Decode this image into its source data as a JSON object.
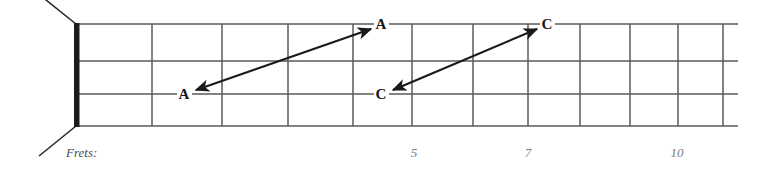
{
  "diagram": {
    "type": "guitar-fretboard",
    "caption": "Frets:",
    "nut": {
      "label": "nut"
    },
    "strings": {
      "count": 4,
      "lines_y": [
        24,
        61,
        94,
        126
      ]
    },
    "frets": {
      "count": 12,
      "lines_x": [
        77,
        152,
        222,
        288,
        353,
        412,
        473,
        528,
        580,
        630,
        678,
        723
      ],
      "numbers": [
        {
          "label": "5",
          "x": 414
        },
        {
          "label": "7",
          "x": 528
        },
        {
          "label": "10",
          "x": 677
        }
      ]
    },
    "notes": [
      {
        "name": "note-a-low",
        "label": "A",
        "x": 184,
        "y": 94,
        "string": 3,
        "fret": 2
      },
      {
        "name": "note-a-high",
        "label": "A",
        "x": 381,
        "y": 24,
        "string": 1,
        "fret": 5
      },
      {
        "name": "note-c-low",
        "label": "C",
        "x": 381,
        "y": 94,
        "string": 3,
        "fret": 5
      },
      {
        "name": "note-c-high",
        "label": "C",
        "x": 547,
        "y": 24,
        "string": 1,
        "fret": 8
      }
    ],
    "arrows": [
      {
        "name": "arrow-a-to-a",
        "from_label": "A",
        "to_label": "A",
        "x1": 196,
        "y1": 90,
        "x2": 371,
        "y2": 29
      },
      {
        "name": "arrow-c-to-c",
        "from_label": "C",
        "to_label": "C",
        "x1": 393,
        "y1": 90,
        "x2": 537,
        "y2": 29
      }
    ],
    "colors": {
      "grid_line": "#5a5a5a",
      "nut": "#1c1c1c",
      "arrow": "#1a1a1a",
      "note_text": "#161616",
      "fret_number_text": "#7a7a7a",
      "caption_text": "#4c4c4c",
      "background": "#ffffff"
    }
  }
}
